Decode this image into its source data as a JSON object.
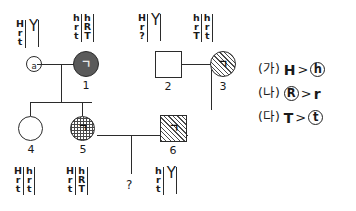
{
  "diagram": {
    "individuals": [
      {
        "id": "a",
        "label": "a",
        "shape": "circle-small-open",
        "sex": "female",
        "haplotype_left": [
          "H",
          "r",
          "t"
        ],
        "haplotype_right": [
          "Y"
        ],
        "right_is_y": true
      },
      {
        "id": "1",
        "label": "1",
        "shape": "circle-solid",
        "sex": "female",
        "mark": "ㄱ",
        "haplotype_left": [
          "h",
          "r",
          "t"
        ],
        "haplotype_right": [
          "h",
          "R",
          "T"
        ],
        "right_is_y": false
      },
      {
        "id": "2",
        "label": "2",
        "shape": "square-open",
        "sex": "male",
        "haplotype_left": [
          "H",
          "r",
          "?"
        ],
        "haplotype_right": [
          "Y"
        ],
        "right_is_y": true
      },
      {
        "id": "3",
        "label": "3",
        "shape": "circle-hatched",
        "sex": "female",
        "mark": "ㄱ",
        "haplotype_left": [
          "h",
          "r",
          "T"
        ],
        "haplotype_right": [
          "h",
          "r",
          "t"
        ],
        "right_is_y": false
      },
      {
        "id": "4",
        "label": "4",
        "shape": "circle-open",
        "sex": "female",
        "haplotype_left": [
          "H",
          "r",
          "t"
        ],
        "haplotype_right": [
          "h",
          "r",
          "t"
        ],
        "right_is_y": false
      },
      {
        "id": "5",
        "label": "5",
        "shape": "circle-grid",
        "sex": "female",
        "mark": "ㄱ",
        "haplotype_left": [
          "H",
          "r",
          "t"
        ],
        "haplotype_right": [
          "h",
          "R",
          "T"
        ],
        "right_is_y": false
      },
      {
        "id": "6",
        "label": "6",
        "shape": "square-hatched",
        "sex": "male",
        "mark": "ㄱ",
        "haplotype_left": [
          "h",
          "r",
          "t"
        ],
        "haplotype_right": [
          "Y"
        ],
        "right_is_y": true
      }
    ],
    "unknown_offspring": {
      "label": "?"
    }
  },
  "legend": {
    "rows": [
      {
        "tag": "(가)",
        "dominant": "H",
        "relation": ">",
        "recessive": "h",
        "recessive_ringed": true,
        "dominant_ringed": false
      },
      {
        "tag": "(나)",
        "dominant": "R",
        "relation": ">",
        "recessive": "r",
        "recessive_ringed": false,
        "dominant_ringed": true
      },
      {
        "tag": "(다)",
        "dominant": "T",
        "relation": ">",
        "recessive": "t",
        "recessive_ringed": true,
        "dominant_ringed": false
      }
    ]
  }
}
